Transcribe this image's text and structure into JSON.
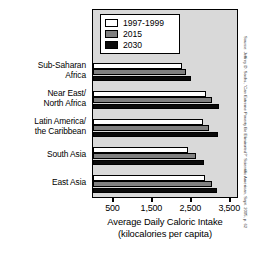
{
  "chart_data": {
    "type": "bar",
    "orientation": "horizontal",
    "title": "",
    "xlabel": "Average Daily Caloric Intake (kilocalories per capita)",
    "xlabel_line1": "Average Daily Caloric Intake",
    "xlabel_line2": "(kilocalories per capita)",
    "ylabel": "",
    "xlim": [
      0,
      3700
    ],
    "xticks": [
      500,
      1500,
      2500,
      3500
    ],
    "xticklabels": [
      "500",
      "1,500",
      "2,500",
      "3,500"
    ],
    "grid": false,
    "legend_position": "top-left",
    "categories": [
      "Sub-Saharan Africa",
      "Near East/ North Africa",
      "Latin America/ the Caribbean",
      "South Asia",
      "East Asia"
    ],
    "category_lines": [
      [
        "Sub-Saharan",
        "Africa"
      ],
      [
        "Near East/",
        "North Africa"
      ],
      [
        "Latin America/",
        "the Caribbean"
      ],
      [
        "South Asia"
      ],
      [
        "East Asia"
      ]
    ],
    "series": [
      {
        "name": "1997-1999",
        "color": "#ffffff",
        "values": [
          2280,
          2900,
          2820,
          2440,
          2880
        ]
      },
      {
        "name": "2015",
        "color": "#808080",
        "values": [
          2380,
          3050,
          2990,
          2650,
          3060
        ]
      },
      {
        "name": "2030",
        "color": "#0a0a0a",
        "values": [
          2520,
          3230,
          3210,
          2850,
          3190
        ]
      }
    ]
  },
  "legend": {
    "items": [
      {
        "label": "1997-1999"
      },
      {
        "label": "2015"
      },
      {
        "label": "2030"
      }
    ]
  },
  "source": {
    "text": "Source: Jeffrey D. Sachs, \"Can Extreme Poverty Be Eliminated?\" Scientific American, Sept. 2005, p. 62"
  },
  "colors": {
    "plot_background": "#d9d9d9",
    "frame": "#000000",
    "series_1": "#ffffff",
    "series_2": "#808080",
    "series_3": "#0a0a0a"
  }
}
